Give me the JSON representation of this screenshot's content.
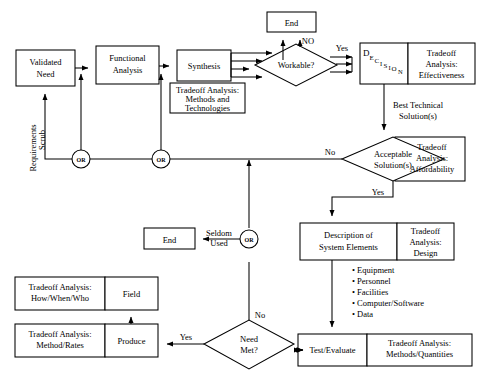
{
  "diagram": {
    "stroke_color": "#000000",
    "fill_color": "#ffffff",
    "nodes": {
      "validated_need": "Validated\nNeed",
      "validated_need_l1": "Validated",
      "validated_need_l2": "Need",
      "functional_analysis_l1": "Functional",
      "functional_analysis_l2": "Analysis",
      "synthesis": "Synthesis",
      "ta_methods_l1": "Tradeoff Analysis:",
      "ta_methods_l2": "Methods and",
      "ta_methods_l3": "Technologies",
      "workable": "Workable?",
      "end_top": "End",
      "decision_word": "DECISION",
      "ta_effectiveness_l1": "Tradeoff",
      "ta_effectiveness_l2": "Analysis:",
      "ta_effectiveness_l3": "Effectiveness",
      "acceptable_l1": "Acceptable",
      "acceptable_l2": "Solution(s)",
      "ta_afford_l1": "Tradeoff",
      "ta_afford_l2": "Analysis:",
      "ta_afford_l3": "Affordability",
      "desc_sys_l1": "Description of",
      "desc_sys_l2": "System Elements",
      "ta_design_l1": "Tradeoff",
      "ta_design_l2": "Analysis:",
      "ta_design_l3": "Design",
      "end_middle": "End",
      "test_evaluate": "Test/Evaluate",
      "ta_methods_qty_l1": "Tradeoff Analysis:",
      "ta_methods_qty_l2": "Methods/Quantities",
      "need_met_l1": "Need",
      "need_met_l2": "Met?",
      "produce": "Produce",
      "ta_method_rates_l1": "Tradeoff Analysis:",
      "ta_method_rates_l2": "Method/Rates",
      "field": "Field",
      "ta_how_when_who_l1": "Tradeoff Analysis:",
      "ta_how_when_who_l2": "How/When/Who",
      "or_gate": "OR"
    },
    "edge_labels": {
      "no_up": "NO",
      "yes_workable": "Yes",
      "best_technical_l1": "Best Technical",
      "best_technical_l2": "Solution(s)",
      "no_acceptable": "No",
      "yes_acceptable": "Yes",
      "seldom_l1": "Seldom",
      "seldom_l2": "Used",
      "no_need_met": "No",
      "yes_need_met": "Yes",
      "requirements_scrub_l1": "Requirements",
      "requirements_scrub_l2": "Scrub"
    },
    "bullets": [
      "• Equipment",
      "• Personnel",
      "• Facilities",
      "• Computer/Software",
      "• Data"
    ]
  }
}
